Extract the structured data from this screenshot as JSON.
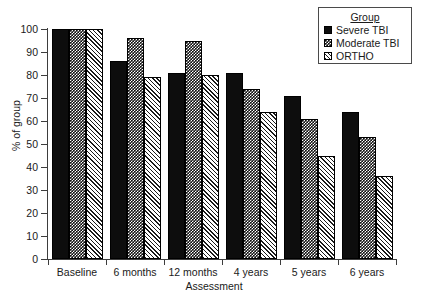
{
  "chart_data": {
    "type": "bar",
    "title": "",
    "xlabel": "Assessment",
    "ylabel": "% of group",
    "categories": [
      "Baseline",
      "6 months",
      "12 months",
      "4 years",
      "5 years",
      "6 years"
    ],
    "series": [
      {
        "name": "Severe TBI",
        "values": [
          100,
          86,
          81,
          81,
          71,
          64
        ]
      },
      {
        "name": "Moderate TBI",
        "values": [
          100,
          96,
          95,
          74,
          61,
          53
        ]
      },
      {
        "name": "ORTHO",
        "values": [
          100,
          79,
          80,
          64,
          45,
          36
        ]
      }
    ],
    "ylim": [
      0,
      100
    ],
    "yticks": [
      0,
      10,
      20,
      30,
      40,
      50,
      60,
      70,
      80,
      90,
      100
    ],
    "ytick_labels": [
      "0",
      "10",
      "20",
      "30",
      "40",
      "50",
      "60",
      "70",
      "80",
      "90",
      "100"
    ],
    "grid": false,
    "legend_position": "top-right"
  },
  "legend": {
    "title": "Group",
    "entries": [
      {
        "label": "Severe TBI",
        "pattern": "solid-black"
      },
      {
        "label": "Moderate TBI",
        "pattern": "checkered"
      },
      {
        "label": "ORTHO",
        "pattern": "diagonal-hatch"
      }
    ]
  },
  "colors": {
    "severe": "#0d0d0d",
    "moderate": "#111111",
    "ortho": "#ffffff",
    "axis": "#3d3d3d",
    "text": "#1a1a1a",
    "background": "#ffffff"
  }
}
